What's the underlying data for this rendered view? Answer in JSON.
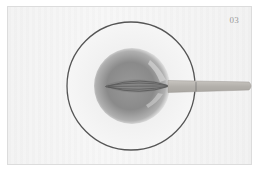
{
  "photo": {
    "step_label": "03",
    "subject": "mixing bowl with whisk",
    "colors": {
      "background": "#f4f4f4",
      "bowl_rim": "#555555",
      "liquid": "#8a8a8a",
      "handle": "#bdbab5"
    }
  }
}
